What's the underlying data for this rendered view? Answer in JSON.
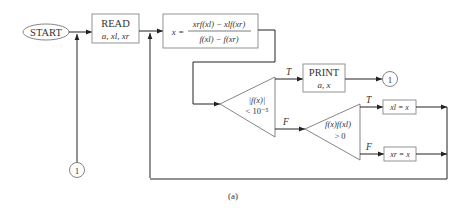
{
  "diagram": {
    "type": "flowchart",
    "caption": "(a)",
    "nodes": {
      "start": {
        "label": "START",
        "shape": "ellipse"
      },
      "read": {
        "label": "READ",
        "sublabel": "a, x_l, x_r",
        "sub_text": "a, xl, xr",
        "shape": "rectangle"
      },
      "compute": {
        "shape": "rectangle",
        "lhs": "x =",
        "numerator": "x_r f(x_l) − x_l f(x_r)",
        "numerator_text": "xrf(xl) − xlf(xr)",
        "denominator": "f(x_l) − f(x_r)",
        "denominator_text": "f(xl) − f(xr)"
      },
      "decision1": {
        "shape": "triangle",
        "line1": "|f(x)|",
        "line2": "< 10⁻⁵"
      },
      "print": {
        "label": "PRINT",
        "sublabel": "a, x",
        "shape": "rectangle"
      },
      "decision2": {
        "shape": "triangle",
        "line1": "f(x)f(xl)",
        "line2": "> 0"
      },
      "assign_left": {
        "label": "xl = x",
        "shape": "rectangle"
      },
      "assign_right": {
        "label": "xr = x",
        "shape": "rectangle"
      },
      "connector_out": {
        "label": "1",
        "shape": "circle"
      },
      "connector_in": {
        "label": "1",
        "shape": "circle"
      }
    },
    "edges": [
      {
        "from": "start",
        "to": "read"
      },
      {
        "from": "connector_in",
        "to": "read"
      },
      {
        "from": "read",
        "to": "compute"
      },
      {
        "from": "compute",
        "to": "decision1"
      },
      {
        "from": "decision1",
        "to": "print",
        "label": "T"
      },
      {
        "from": "decision1",
        "to": "decision2",
        "label": "F"
      },
      {
        "from": "print",
        "to": "connector_out"
      },
      {
        "from": "decision2",
        "to": "assign_left",
        "label": "T"
      },
      {
        "from": "decision2",
        "to": "assign_right",
        "label": "F"
      },
      {
        "from": "assign_left",
        "to": "compute"
      },
      {
        "from": "assign_right",
        "to": "compute"
      }
    ],
    "edge_labels": {
      "true": "T",
      "false": "F"
    },
    "colors": {
      "stroke": "#333333",
      "box_stroke": "#888888",
      "text": "#333333"
    }
  }
}
